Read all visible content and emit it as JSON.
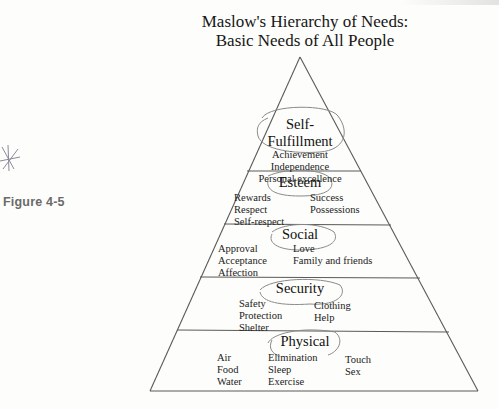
{
  "figure": {
    "label": "Figure 4-5",
    "title_line1": "Maslow's Hierarchy of Needs:",
    "title_line2": "Basic Needs of All People"
  },
  "pyramid": {
    "line_color": "#5a5a5a",
    "annotation_color": "#7a7a7a",
    "levels": [
      {
        "name": "Self-Fulfillment",
        "title_line1": "Self-",
        "title_line2": "Fulfillment",
        "items": [
          "Achievement",
          "Independence",
          "Personal excellence"
        ]
      },
      {
        "name": "Esteem",
        "title": "Esteem",
        "left": [
          "Rewards",
          "Respect",
          "Self-respect"
        ],
        "right": [
          "Success",
          "Possessions"
        ]
      },
      {
        "name": "Social",
        "title": "Social",
        "left": [
          "Approval",
          "Acceptance",
          "Affection"
        ],
        "right": [
          "Love",
          "Family and friends"
        ]
      },
      {
        "name": "Security",
        "title": "Security",
        "left": [
          "Safety",
          "Protection",
          "Shelter"
        ],
        "right": [
          "Clothing",
          "Help"
        ]
      },
      {
        "name": "Physical",
        "title": "Physical",
        "col1": [
          "Air",
          "Food",
          "Water"
        ],
        "col2": [
          "Elimination",
          "Sleep",
          "Exercise"
        ],
        "col3": [
          "Touch",
          "Sex"
        ]
      }
    ]
  },
  "annotations": {
    "asterisk_icon": "hand-drawn-asterisk",
    "circled_titles": [
      "Self-Fulfillment",
      "Esteem",
      "Social",
      "Security",
      "Physical"
    ]
  }
}
